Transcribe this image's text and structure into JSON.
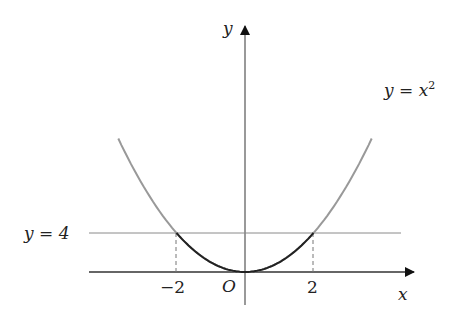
{
  "chart_data": {
    "type": "line",
    "title": "",
    "xlabel": "x",
    "ylabel": "y",
    "origin_label": "O",
    "x_ticks": [
      {
        "value": -2,
        "label": "-2"
      },
      {
        "value": 2,
        "label": "2"
      }
    ],
    "series": [
      {
        "name": "y = x^2",
        "function": "x^2",
        "x_range": [
          -3.7,
          3.7
        ],
        "highlight_range": [
          -2,
          2
        ],
        "color": "#999999",
        "highlight_color": "#222222"
      },
      {
        "name": "y = 4",
        "function": "4",
        "x_range": [
          -3.6,
          4.4
        ],
        "color": "#888888"
      }
    ],
    "dashed_verticals": [
      -2,
      2
    ],
    "xlim": [
      -3.6,
      4.8
    ],
    "ylim": [
      -1.2,
      13
    ],
    "grid": false,
    "legend": "none"
  },
  "labels": {
    "y_axis": "y",
    "x_axis": "x",
    "origin": "O",
    "tick_neg2": "−2",
    "tick_2": "2",
    "curve_label_lhs": "y = x",
    "curve_label_exp": "2",
    "line_label": "y = 4"
  },
  "colors": {
    "axis": "#333333",
    "curve": "#9a9a9a",
    "curve_highlight": "#1a1a1a",
    "horizontal_line": "#8a8a8a"
  }
}
